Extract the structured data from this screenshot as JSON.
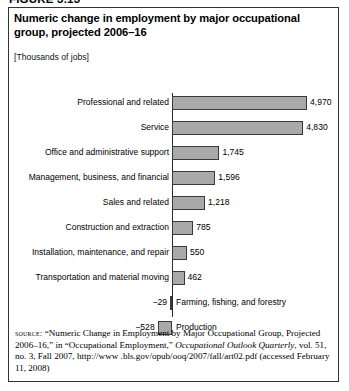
{
  "figure": {
    "tag": "FIGURE 3.13",
    "title": "Numeric change in employment by major occupational group, projected 2006–16",
    "units": "[Thousands of jobs]"
  },
  "source": {
    "label": "source:",
    "line1": " “Numeric Change in Employment by Major Occupational",
    "line2": "Group, Projected 2006–16,” in “Occupational Employment,”",
    "journal": "Occupational Outlook Quarterly",
    "line3_rest": ", vol. 51, no. 3, Fall 2007, http://www",
    "line4": ".bls.gov/opub/ooq/2007/fall/art02.pdf (accessed February 11, 2008)"
  },
  "chart_data": {
    "type": "bar",
    "orientation": "horizontal",
    "title": "Numeric change in employment by major occupational group, projected 2006–16",
    "subtitle": "[Thousands of jobs]",
    "xlabel": "",
    "ylabel": "",
    "units": "Thousands of jobs",
    "grid": false,
    "legend": false,
    "axis_zero": true,
    "xlim": [
      -800,
      5200
    ],
    "categories": [
      "Professional and related",
      "Service",
      "Office and administrative support",
      "Management, business, and financial",
      "Sales and related",
      "Construction and extraction",
      "Installation, maintenance, and repair",
      "Transportation and material moving",
      "Farming, fishing, and forestry",
      "Production"
    ],
    "values": [
      4970,
      4830,
      1745,
      1596,
      1218,
      785,
      550,
      462,
      -29,
      -528
    ],
    "value_labels": [
      "4,970",
      "4,830",
      "1,745",
      "1,596",
      "1,218",
      "785",
      "550",
      "462",
      "−29",
      "−528"
    ],
    "bar_color": "#a9a9a9",
    "bar_border_color": "#3a3a3a"
  }
}
